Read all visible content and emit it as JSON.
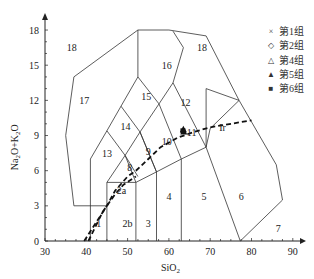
{
  "chart_data": {
    "type": "scatter",
    "title": "",
    "xlabel": "SiO2",
    "ylabel": "Na2O+K2O",
    "xlim": [
      30,
      92
    ],
    "ylim": [
      0,
      19
    ],
    "x_ticks": [
      30,
      40,
      50,
      60,
      70,
      80,
      90
    ],
    "y_ticks": [
      0,
      3,
      6,
      9,
      12,
      15,
      18
    ],
    "grid": false,
    "legend_position": "top-right",
    "legend": [
      {
        "symbol": "×",
        "label": "第1组"
      },
      {
        "symbol": "◇",
        "label": "第2组"
      },
      {
        "symbol": "△",
        "label": "第4组"
      },
      {
        "symbol": "▲",
        "label": "第5组"
      },
      {
        "symbol": "■",
        "label": "第6组"
      }
    ],
    "field_labels": [
      {
        "id": "1",
        "x": 43,
        "y": 1.5
      },
      {
        "id": "2a",
        "x": 48.5,
        "y": 4.3
      },
      {
        "id": "2b",
        "x": 50,
        "y": 1.5
      },
      {
        "id": "3",
        "x": 55,
        "y": 1.5
      },
      {
        "id": "4",
        "x": 60,
        "y": 3.8
      },
      {
        "id": "5",
        "x": 68.5,
        "y": 3.8
      },
      {
        "id": "6",
        "x": 77.5,
        "y": 3.8
      },
      {
        "id": "7",
        "x": 86.5,
        "y": 1.1
      },
      {
        "id": "8",
        "x": 50.5,
        "y": 6.3
      },
      {
        "id": "9",
        "x": 55,
        "y": 7.6
      },
      {
        "id": "10",
        "x": 59.5,
        "y": 8.5
      },
      {
        "id": "11",
        "x": 65.5,
        "y": 9.3
      },
      {
        "id": "12",
        "x": 64,
        "y": 11.8
      },
      {
        "id": "13",
        "x": 45,
        "y": 7.5
      },
      {
        "id": "14",
        "x": 49.5,
        "y": 9.8
      },
      {
        "id": "15",
        "x": 54.5,
        "y": 12.3
      },
      {
        "id": "16",
        "x": 59.5,
        "y": 15
      },
      {
        "id": "17",
        "x": 39.5,
        "y": 12
      },
      {
        "id": "18a",
        "x": 36.5,
        "y": 16.5
      },
      {
        "id": "18b",
        "x": 68,
        "y": 16.5
      }
    ],
    "boundary_labels": [
      {
        "text": "Ir",
        "x": 73,
        "y": 9.7
      }
    ],
    "points": [
      {
        "group": "第5组",
        "x": 63.5,
        "y": 9.5
      },
      {
        "group": "第5组",
        "x": 63.6,
        "y": 9.3
      },
      {
        "group": "第6组",
        "x": 63.4,
        "y": 9.4
      }
    ]
  },
  "legend": {
    "items": [
      {
        "symbol": "×",
        "label": "第1组"
      },
      {
        "symbol": "◇",
        "label": "第2组"
      },
      {
        "symbol": "△",
        "label": "第4组"
      },
      {
        "symbol": "▲",
        "label": "第5组"
      },
      {
        "symbol": "■",
        "label": "第6组"
      }
    ]
  },
  "axes": {
    "x_title": "SiO",
    "x_sub": "2",
    "y_title": "Na2O+K2O",
    "x_ticks": [
      "30",
      "40",
      "50",
      "60",
      "70",
      "80",
      "90"
    ],
    "y_ticks": [
      "0",
      "3",
      "6",
      "9",
      "12",
      "15",
      "18"
    ]
  }
}
